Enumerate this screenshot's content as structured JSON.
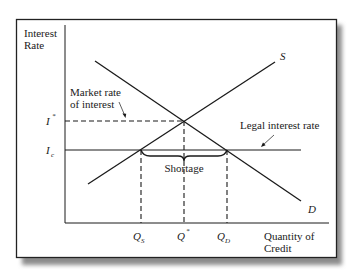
{
  "diagram": {
    "type": "supply-demand-price-ceiling",
    "y_axis_label": [
      "Interest",
      "Rate"
    ],
    "x_axis_label": [
      "Quantity of",
      "Credit"
    ],
    "curves": {
      "supply": {
        "label": "S"
      },
      "demand": {
        "label": "D"
      }
    },
    "y_ticks": {
      "equilibrium": {
        "base": "I",
        "sup": "*"
      },
      "ceiling": {
        "base": "I",
        "sub": "c"
      }
    },
    "x_ticks": {
      "supplied": {
        "base": "Q",
        "sub": "S"
      },
      "equilibrium": {
        "base": "Q",
        "sup": "*"
      },
      "demanded": {
        "base": "Q",
        "sub": "D"
      }
    },
    "annotations": {
      "market_rate": [
        "Market rate",
        "of interest"
      ],
      "legal_rate": "Legal interest rate",
      "shortage": "Shortage"
    },
    "colors": {
      "line": "#1a1a1a",
      "frame": "#222222",
      "shadow": "#9a9a9a",
      "background": "#ffffff"
    }
  }
}
